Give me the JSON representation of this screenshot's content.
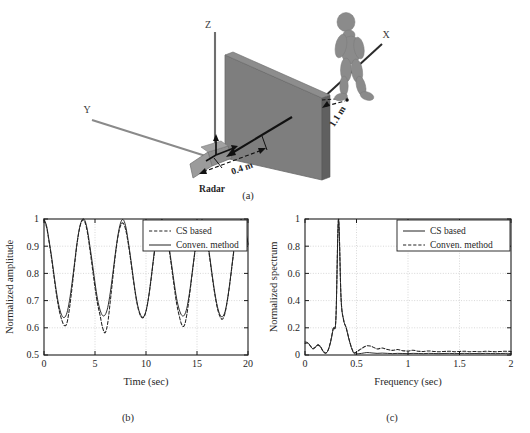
{
  "figure": {
    "panel_a_caption": "(a)",
    "panel_b_caption": "(b)",
    "panel_c_caption": "(c)"
  },
  "diagram": {
    "axis_z_label": "Z",
    "axis_x_label": "X",
    "axis_y_label": "Y",
    "radar_label": "Radar",
    "distance_wall_label": "0.4 m",
    "distance_human_label": "1.1 m",
    "colors": {
      "wall_face": "#7e7e7e",
      "wall_edge": "#5d5d5d",
      "human": "#8a8a8a",
      "radar_body": "#909090",
      "axis_line": "#6a6a6a",
      "arrow": "#1a1a1a"
    }
  },
  "chart_data": [
    {
      "id": "panel-b",
      "type": "line",
      "title": "",
      "xlabel": "Time (sec)",
      "ylabel": "Normalized amplitude",
      "xlim": [
        0,
        20
      ],
      "ylim": [
        0.5,
        1
      ],
      "xticks": [
        0,
        5,
        10,
        15,
        20
      ],
      "xticklabels": [
        "0",
        "5",
        "10",
        "15",
        "20"
      ],
      "yticks": [
        0.5,
        0.6,
        0.7,
        0.8,
        0.9,
        1
      ],
      "yticklabels": [
        "0.5",
        "0.6",
        "0.7",
        "0.8",
        "0.9",
        "1"
      ],
      "grid": true,
      "legend_position": "top-right",
      "legend": [
        {
          "label": "CS based",
          "style": "dashed"
        },
        {
          "label": "Conven. method",
          "style": "solid"
        }
      ],
      "x": [
        0,
        0.25,
        0.5,
        0.75,
        1,
        1.25,
        1.5,
        1.75,
        2,
        2.25,
        2.5,
        2.75,
        3,
        3.25,
        3.5,
        3.75,
        4,
        4.25,
        4.5,
        4.75,
        5,
        5.25,
        5.5,
        5.75,
        6,
        6.25,
        6.5,
        6.75,
        7,
        7.25,
        7.5,
        7.75,
        8,
        8.25,
        8.5,
        8.75,
        9,
        9.25,
        9.5,
        9.75,
        10,
        10.25,
        10.5,
        10.75,
        11,
        11.25,
        11.5,
        11.75,
        12,
        12.25,
        12.5,
        12.75,
        13,
        13.25,
        13.5,
        13.75,
        14,
        14.25,
        14.5,
        14.75,
        15,
        15.25,
        15.5,
        15.75,
        16,
        16.25,
        16.5,
        16.75,
        17,
        17.25,
        17.5,
        17.75,
        18,
        18.25,
        18.5,
        18.75,
        19,
        19.25,
        19.5,
        19.75,
        20
      ],
      "series": [
        {
          "name": "Conven. method",
          "style": "solid",
          "values": [
            1.0,
            0.975,
            0.92,
            0.86,
            0.79,
            0.725,
            0.675,
            0.645,
            0.638,
            0.655,
            0.7,
            0.765,
            0.84,
            0.915,
            0.97,
            0.998,
            0.995,
            0.96,
            0.9,
            0.835,
            0.765,
            0.705,
            0.665,
            0.645,
            0.648,
            0.675,
            0.73,
            0.8,
            0.875,
            0.94,
            0.985,
            0.998,
            0.975,
            0.92,
            0.855,
            0.785,
            0.72,
            0.672,
            0.645,
            0.64,
            0.662,
            0.712,
            0.782,
            0.86,
            0.93,
            0.978,
            0.998,
            0.99,
            0.955,
            0.9,
            0.835,
            0.768,
            0.708,
            0.668,
            0.646,
            0.646,
            0.672,
            0.725,
            0.795,
            0.87,
            0.935,
            0.982,
            0.998,
            0.978,
            0.928,
            0.862,
            0.792,
            0.728,
            0.678,
            0.648,
            0.641,
            0.66,
            0.708,
            0.775,
            0.852,
            0.925,
            0.975,
            0.997,
            0.992,
            0.96,
            0.91,
            0.86
          ]
        },
        {
          "name": "CS based",
          "style": "dashed",
          "values": [
            0.995,
            0.97,
            0.915,
            0.852,
            0.782,
            0.715,
            0.662,
            0.628,
            0.608,
            0.618,
            0.672,
            0.748,
            0.832,
            0.912,
            0.968,
            0.995,
            0.99,
            0.952,
            0.888,
            0.818,
            0.748,
            0.688,
            0.645,
            0.6,
            0.582,
            0.618,
            0.698,
            0.785,
            0.868,
            0.935,
            0.975,
            0.985,
            0.962,
            0.912,
            0.848,
            0.778,
            0.715,
            0.668,
            0.642,
            0.638,
            0.66,
            0.71,
            0.778,
            0.855,
            0.925,
            0.972,
            0.99,
            0.982,
            0.948,
            0.892,
            0.825,
            0.755,
            0.69,
            0.645,
            0.612,
            0.608,
            0.648,
            0.715,
            0.79,
            0.865,
            0.93,
            0.976,
            0.994,
            0.972,
            0.92,
            0.855,
            0.785,
            0.722,
            0.672,
            0.642,
            0.632,
            0.655,
            0.705,
            0.772,
            0.848,
            0.92,
            0.97,
            0.994,
            0.988,
            0.955,
            0.905,
            0.855
          ]
        }
      ]
    },
    {
      "id": "panel-c",
      "type": "line",
      "title": "",
      "xlabel": "Frequency (sec)",
      "ylabel": "Normalized spectrum",
      "xlim": [
        0,
        2
      ],
      "ylim": [
        0,
        1
      ],
      "xticks": [
        0,
        0.5,
        1,
        1.5,
        2
      ],
      "xticklabels": [
        "0",
        "0.5",
        "1",
        "1.5",
        "2"
      ],
      "yticks": [
        0,
        0.2,
        0.4,
        0.6,
        0.8,
        1
      ],
      "yticklabels": [
        "0",
        "0.2",
        "0.4",
        "0.6",
        "0.8",
        "1"
      ],
      "grid": true,
      "legend_position": "top-right",
      "legend": [
        {
          "label": "CS based",
          "style": "solid"
        },
        {
          "label": "Conven. method",
          "style": "dashed"
        }
      ],
      "x": [
        0,
        0.025,
        0.05,
        0.075,
        0.1,
        0.125,
        0.15,
        0.175,
        0.2,
        0.225,
        0.25,
        0.275,
        0.3,
        0.325,
        0.35,
        0.375,
        0.4,
        0.425,
        0.45,
        0.475,
        0.5,
        0.55,
        0.6,
        0.65,
        0.7,
        0.75,
        0.8,
        0.85,
        0.9,
        0.95,
        1,
        1.05,
        1.1,
        1.15,
        1.2,
        1.25,
        1.3,
        1.35,
        1.4,
        1.45,
        1.5,
        1.55,
        1.6,
        1.65,
        1.7,
        1.75,
        1.8,
        1.85,
        1.9,
        1.95,
        2
      ],
      "peak_frequency": 0.33,
      "series": [
        {
          "name": "CS based",
          "style": "solid",
          "values": [
            0.095,
            0.092,
            0.07,
            0.045,
            0.055,
            0.078,
            0.062,
            0.028,
            0.012,
            0.035,
            0.1,
            0.195,
            0.265,
            1.0,
            0.42,
            0.26,
            0.2,
            0.12,
            0.055,
            0.012,
            0.008,
            0.012,
            0.018,
            0.015,
            0.012,
            0.014,
            0.012,
            0.01,
            0.012,
            0.011,
            0.01,
            0.012,
            0.011,
            0.01,
            0.012,
            0.011,
            0.01,
            0.011,
            0.012,
            0.01,
            0.011,
            0.012,
            0.01,
            0.011,
            0.01,
            0.012,
            0.011,
            0.01,
            0.011,
            0.012,
            0.011
          ]
        },
        {
          "name": "Conven. method",
          "style": "dashed",
          "values": [
            0.085,
            0.088,
            0.068,
            0.048,
            0.058,
            0.072,
            0.06,
            0.03,
            0.015,
            0.038,
            0.105,
            0.2,
            0.27,
            0.995,
            0.415,
            0.255,
            0.2,
            0.125,
            0.058,
            0.018,
            0.022,
            0.048,
            0.068,
            0.062,
            0.045,
            0.052,
            0.04,
            0.034,
            0.04,
            0.032,
            0.03,
            0.035,
            0.028,
            0.026,
            0.03,
            0.026,
            0.024,
            0.026,
            0.028,
            0.024,
            0.026,
            0.028,
            0.024,
            0.026,
            0.024,
            0.028,
            0.026,
            0.024,
            0.026,
            0.028,
            0.026
          ]
        }
      ]
    }
  ]
}
